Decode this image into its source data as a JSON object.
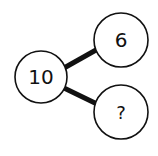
{
  "diagram": {
    "type": "number-bond",
    "whole": {
      "label": "10"
    },
    "parts": [
      {
        "label": "6"
      },
      {
        "label": "?"
      }
    ],
    "colors": {
      "stroke": "#111111",
      "fill": "#ffffff"
    }
  }
}
